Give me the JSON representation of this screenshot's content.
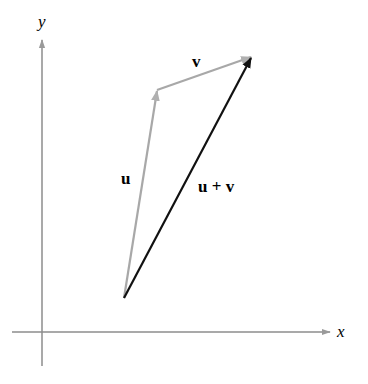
{
  "diagram": {
    "axes": {
      "x_label": "x",
      "y_label": "y",
      "color": "#8c8c8c"
    },
    "vectors": [
      {
        "name": "u",
        "label": "u",
        "from": [
          124,
          298
        ],
        "to": [
          157,
          90
        ],
        "color": "#a8a8a8"
      },
      {
        "name": "v",
        "label": "v",
        "from": [
          157,
          90
        ],
        "to": [
          252,
          56
        ],
        "color": "#a8a8a8"
      },
      {
        "name": "u_plus_v",
        "label": "u + v",
        "from": [
          124,
          298
        ],
        "to": [
          252,
          56
        ],
        "color": "#111111"
      }
    ]
  }
}
